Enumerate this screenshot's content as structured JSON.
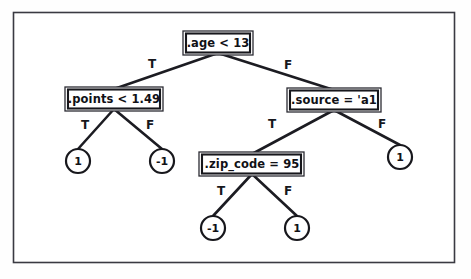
{
  "diagram": {
    "type": "decision-tree",
    "title": "",
    "frame": {
      "stroke_color": "#3a3a42"
    },
    "colors": {
      "background": "#ffffff",
      "node_stroke": "#17171c",
      "edge_stroke": "#1c1c22",
      "text": "#111116"
    },
    "nodes": [
      {
        "id": "root",
        "kind": "decision",
        "label": ".age < 13",
        "x": 218,
        "y": 43,
        "w": 64,
        "h": 20
      },
      {
        "id": "points",
        "kind": "decision",
        "label": ".points < 1.49",
        "x": 114,
        "y": 99,
        "w": 92,
        "h": 20
      },
      {
        "id": "source",
        "kind": "decision",
        "label": ".source = 'a1",
        "x": 334,
        "y": 100,
        "w": 88,
        "h": 20
      },
      {
        "id": "zip",
        "kind": "decision",
        "label": ".zip_code = 95",
        "x": 252,
        "y": 164,
        "w": 99,
        "h": 20
      },
      {
        "id": "leaf-points-true",
        "kind": "leaf",
        "label": "1",
        "x": 78,
        "y": 161,
        "r": 12
      },
      {
        "id": "leaf-points-false",
        "kind": "leaf",
        "label": "-1",
        "x": 162,
        "y": 161,
        "r": 12
      },
      {
        "id": "leaf-source-false",
        "kind": "leaf",
        "label": "1",
        "x": 400,
        "y": 157,
        "r": 12
      },
      {
        "id": "leaf-zip-true",
        "kind": "leaf",
        "label": "-1",
        "x": 213,
        "y": 228,
        "r": 12
      },
      {
        "id": "leaf-zip-false",
        "kind": "leaf",
        "label": "1",
        "x": 297,
        "y": 228,
        "r": 12
      }
    ],
    "edges": [
      {
        "from": "root",
        "to": "points",
        "label": "T",
        "label_x": 152,
        "label_y": 64
      },
      {
        "from": "root",
        "to": "source",
        "label": "F",
        "label_x": 288,
        "label_y": 65
      },
      {
        "from": "points",
        "to": "leaf-points-true",
        "label": "T",
        "label_x": 85,
        "label_y": 125
      },
      {
        "from": "points",
        "to": "leaf-points-false",
        "label": "F",
        "label_x": 150,
        "label_y": 125
      },
      {
        "from": "source",
        "to": "zip",
        "label": "T",
        "label_x": 272,
        "label_y": 124
      },
      {
        "from": "source",
        "to": "leaf-source-false",
        "label": "F",
        "label_x": 382,
        "label_y": 124
      },
      {
        "from": "zip",
        "to": "leaf-zip-true",
        "label": "T",
        "label_x": 221,
        "label_y": 191
      },
      {
        "from": "zip",
        "to": "leaf-zip-false",
        "label": "F",
        "label_x": 288,
        "label_y": 191
      }
    ]
  }
}
